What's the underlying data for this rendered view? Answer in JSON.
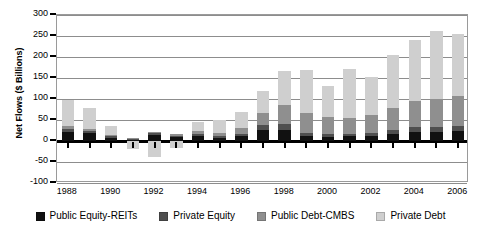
{
  "chart_data": {
    "type": "bar",
    "subtype": "stacked-bar",
    "title": "",
    "xlabel": "",
    "ylabel": "Net Flows ($ Billions)",
    "ylim": [
      -100,
      300
    ],
    "ytick_values": [
      -100,
      -50,
      0,
      50,
      100,
      150,
      200,
      250,
      300
    ],
    "ytick_labels": [
      "-100",
      "-50",
      "0",
      "50",
      "100",
      "150",
      "200",
      "250",
      "300"
    ],
    "grid": true,
    "legend_position": "bottom",
    "categories": [
      "1988",
      "1989",
      "1990",
      "1991",
      "1992",
      "1993",
      "1994",
      "1995",
      "1996",
      "1997",
      "1998",
      "1999",
      "2000",
      "2001",
      "2002",
      "2003",
      "2004",
      "2005",
      "2006"
    ],
    "xtick_labels_shown": [
      "1988",
      "1990",
      "1992",
      "1994",
      "1996",
      "1998",
      "2000",
      "2002",
      "2004",
      "2006"
    ],
    "series": [
      {
        "name": "Public Equity-REITs",
        "color": "#111111",
        "values": [
          22,
          20,
          8,
          3,
          14,
          10,
          13,
          7,
          12,
          26,
          26,
          11,
          9,
          11,
          13,
          17,
          21,
          22,
          23
        ]
      },
      {
        "name": "Private Equity",
        "color": "#4f4f4f",
        "values": [
          6,
          4,
          3,
          2,
          4,
          3,
          4,
          4,
          5,
          13,
          14,
          9,
          7,
          5,
          6,
          10,
          12,
          12,
          13
        ]
      },
      {
        "name": "Public Debt-CMBS",
        "color": "#8f8f8f",
        "values": [
          7,
          5,
          4,
          2,
          3,
          3,
          6,
          9,
          14,
          27,
          45,
          47,
          41,
          38,
          42,
          52,
          62,
          66,
          71
        ]
      },
      {
        "name": "Private Debt",
        "color": "#cfcfcf",
        "values": [
          63,
          50,
          20,
          -20,
          -37,
          -16,
          22,
          30,
          38,
          54,
          82,
          103,
          73,
          118,
          92,
          125,
          146,
          163,
          148
        ]
      }
    ],
    "totals": [
      98,
      79,
      35,
      -13,
      -16,
      0,
      45,
      50,
      69,
      120,
      167,
      170,
      130,
      172,
      153,
      204,
      241,
      263,
      255
    ]
  },
  "legend": {
    "items": [
      {
        "label": "Public Equity-REITs",
        "color": "#111111"
      },
      {
        "label": "Private Equity",
        "color": "#4f4f4f"
      },
      {
        "label": "Public Debt-CMBS",
        "color": "#8f8f8f"
      },
      {
        "label": "Private Debt",
        "color": "#cfcfcf"
      }
    ]
  }
}
